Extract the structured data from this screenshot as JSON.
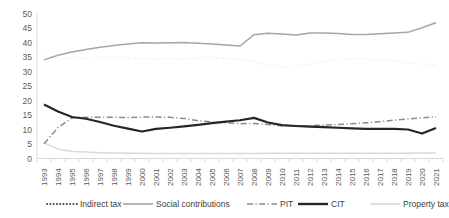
{
  "chart_data": {
    "type": "line",
    "title": "",
    "xlabel": "",
    "ylabel": "",
    "ylim": [
      0,
      50
    ],
    "ytick_step": 5,
    "grid": false,
    "legend_position": "bottom",
    "categories": [
      "1993",
      "1994",
      "1995",
      "1996",
      "1997",
      "1998",
      "1999",
      "2000",
      "2001",
      "2002",
      "2003",
      "2004",
      "2005",
      "2006",
      "2007",
      "2008",
      "2009",
      "2010",
      "2011",
      "2012",
      "2013",
      "2014",
      "2015",
      "2016",
      "2017",
      "2018",
      "2019",
      "2020",
      "2021"
    ],
    "yticks": [
      "0",
      "5",
      "10",
      "15",
      "20",
      "25",
      "30",
      "35",
      "40",
      "45",
      "50"
    ],
    "series": [
      {
        "name": "Indirect tax",
        "style": "dotted",
        "color": "#3f3f3f",
        "values": [
          35.5,
          34.3,
          34.6,
          34.5,
          34.6,
          35.0,
          34.6,
          34.4,
          34.4,
          34.2,
          34.2,
          34.6,
          34.8,
          34.4,
          34.2,
          33.6,
          32.0,
          31.6,
          31.8,
          32.6,
          33.4,
          34.2,
          34.3,
          34.2,
          34.0,
          33.7,
          33.2,
          32.6,
          32.2
        ]
      },
      {
        "name": "Social contributions",
        "style": "solid-gray",
        "color": "#a6a6a6",
        "values": [
          34.0,
          35.6,
          36.7,
          37.6,
          38.4,
          39.0,
          39.5,
          39.9,
          39.8,
          39.9,
          40.0,
          39.7,
          39.5,
          39.1,
          38.8,
          42.7,
          43.2,
          42.9,
          42.6,
          43.3,
          43.3,
          43.1,
          42.8,
          42.8,
          43.0,
          43.3,
          43.5,
          45.1,
          46.8
        ]
      },
      {
        "name": "PIT",
        "style": "dash-dot",
        "color": "#8c8c8c",
        "values": [
          5.1,
          10.7,
          14.0,
          14.2,
          14.2,
          14.2,
          14.1,
          14.3,
          14.3,
          14.2,
          13.8,
          13.0,
          12.6,
          12.3,
          12.0,
          12.1,
          11.7,
          11.3,
          11.2,
          11.3,
          11.5,
          11.7,
          12.0,
          12.3,
          12.7,
          13.2,
          13.6,
          14.0,
          14.4
        ]
      },
      {
        "name": "CIT",
        "style": "solid-black",
        "color": "#262626",
        "values": [
          18.6,
          16.2,
          14.3,
          13.7,
          12.6,
          11.3,
          10.3,
          9.3,
          10.2,
          10.6,
          11.1,
          11.6,
          12.2,
          12.7,
          13.2,
          14.0,
          12.4,
          11.5,
          11.2,
          11.0,
          10.8,
          10.6,
          10.4,
          10.2,
          10.2,
          10.2,
          10.0,
          8.6,
          10.5
        ]
      },
      {
        "name": "Property tax",
        "style": "solid-light",
        "color": "#d9d9d9",
        "values": [
          5.4,
          3.3,
          2.4,
          2.2,
          2.0,
          1.9,
          1.8,
          1.8,
          1.7,
          1.7,
          1.7,
          1.7,
          1.7,
          1.7,
          1.7,
          1.7,
          1.8,
          1.8,
          1.8,
          1.8,
          1.8,
          1.8,
          1.8,
          1.8,
          1.8,
          1.8,
          1.8,
          1.9,
          1.9
        ]
      }
    ]
  },
  "legend": {
    "items": [
      {
        "label": "Indirect tax",
        "marker": "dotted-marker"
      },
      {
        "label": "Social contributions",
        "marker": "solid-gray-marker"
      },
      {
        "label": "PIT",
        "marker": "dash-dot-marker"
      },
      {
        "label": "CIT",
        "marker": "solid-black-marker"
      },
      {
        "label": "Property tax",
        "marker": "solid-light-marker"
      }
    ]
  },
  "colors": {
    "indirect_tax": "#3f3f3f",
    "social_contributions": "#a6a6a6",
    "pit": "#8c8c8c",
    "cit": "#262626",
    "property_tax": "#d9d9d9",
    "axis": "#d9d9d9",
    "tick_text": "#595959"
  }
}
